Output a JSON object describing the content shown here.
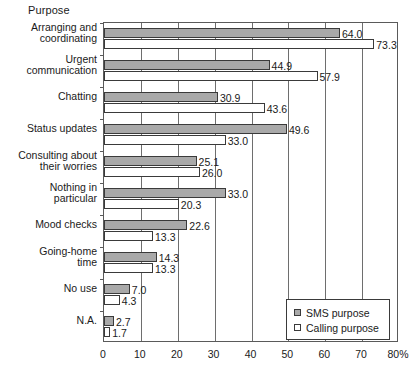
{
  "chart_data": {
    "type": "bar",
    "orientation": "horizontal",
    "title": "Purpose",
    "xlabel": "",
    "ylabel": "",
    "xlim": [
      0,
      80
    ],
    "xticks": [
      0,
      10,
      20,
      30,
      40,
      50,
      60,
      70,
      80
    ],
    "xtick_labels": [
      "0",
      "10",
      "20",
      "30",
      "40",
      "50",
      "60",
      "70",
      "80%"
    ],
    "grid": true,
    "legend_position": "bottom-right",
    "categories": [
      "Arranging and\ncoordinating",
      "Urgent\ncommunication",
      "Chatting",
      "Status updates",
      "Consulting about\ntheir worries",
      "Nothing in\nparticular",
      "Mood checks",
      "Going-home\ntime",
      "No use",
      "N.A."
    ],
    "series": [
      {
        "name": "SMS purpose",
        "color": "#a9a9a9",
        "values": [
          64.0,
          44.9,
          30.9,
          49.6,
          25.1,
          33.0,
          22.6,
          14.3,
          7.0,
          2.7
        ],
        "labels": [
          "64.0",
          "44.9",
          "30.9",
          "49.6",
          "25.1",
          "33.0",
          "22.6",
          "14.3",
          "7.0",
          "2.7"
        ]
      },
      {
        "name": "Calling purpose",
        "color": "#ffffff",
        "values": [
          73.3,
          57.9,
          43.6,
          33.0,
          26.0,
          20.3,
          13.3,
          13.3,
          4.3,
          1.7
        ],
        "labels": [
          "73.3",
          "57.9",
          "43.6",
          "33.0",
          "26.0",
          "20.3",
          "13.3",
          "13.3",
          "4.3",
          "1.7"
        ]
      }
    ]
  },
  "legend": {
    "items": [
      {
        "label": "SMS purpose",
        "swatch": "sms"
      },
      {
        "label": "Calling purpose",
        "swatch": "calling"
      }
    ]
  }
}
